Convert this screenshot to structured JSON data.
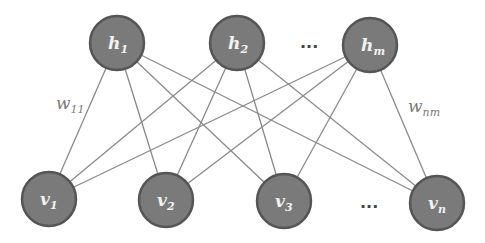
{
  "diagram": {
    "type": "bipartite-network",
    "hidden_layer": {
      "nodes": [
        {
          "id": "h1",
          "base": "h",
          "sub": "1",
          "x": 117,
          "y": 43
        },
        {
          "id": "h2",
          "base": "h",
          "sub": "2",
          "x": 237,
          "y": 43
        },
        {
          "id": "hm",
          "base": "h",
          "sub": "m",
          "x": 370,
          "y": 45
        }
      ],
      "ellipsis": {
        "text": "...",
        "x": 300,
        "y": 48
      }
    },
    "visible_layer": {
      "nodes": [
        {
          "id": "v1",
          "base": "v",
          "sub": "1",
          "x": 49,
          "y": 199
        },
        {
          "id": "v2",
          "base": "v",
          "sub": "2",
          "x": 166,
          "y": 200
        },
        {
          "id": "v3",
          "base": "v",
          "sub": "3",
          "x": 284,
          "y": 201
        },
        {
          "id": "vn",
          "base": "v",
          "sub": "n",
          "x": 437,
          "y": 203
        }
      ],
      "ellipsis": {
        "text": "...",
        "x": 360,
        "y": 208
      }
    },
    "weight_labels": [
      {
        "id": "w11",
        "base": "w",
        "sub": "11",
        "x": 56,
        "y": 109
      },
      {
        "id": "wnm",
        "base": "w",
        "sub": "nm",
        "x": 408,
        "y": 112
      }
    ],
    "node_radius": 27,
    "colors": {
      "node_fill": "#7a7a7a",
      "node_stroke": "#555555",
      "edge": "#8a8a8a",
      "label": "#f2f2f2",
      "weight_label": "#7a7a7a"
    }
  }
}
